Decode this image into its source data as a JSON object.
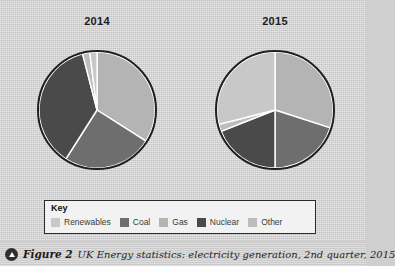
{
  "figure": {
    "number_label": "Figure 2",
    "caption": "UK Energy statistics: electricity generation, 2nd quarter, 2015",
    "icon": "triangle-up-circle-icon"
  },
  "key": {
    "title": "Key",
    "items": [
      {
        "label": "Renewables",
        "color": "#c8c8c8"
      },
      {
        "label": "Coal",
        "color": "#6e6e6e"
      },
      {
        "label": "Gas",
        "color": "#b4b4b4"
      },
      {
        "label": "Nuclear",
        "color": "#4a4a4a"
      },
      {
        "label": "Other",
        "color": "#bdbdbd"
      }
    ]
  },
  "chart_data": {
    "type": "pie",
    "title": "UK Energy statistics: electricity generation, 2nd quarter, 2015",
    "legend_position": "bottom",
    "categories": [
      "Gas",
      "Coal",
      "Nuclear",
      "Other",
      "Renewables"
    ],
    "colors": {
      "Renewables": "#c8c8c8",
      "Coal": "#6e6e6e",
      "Gas": "#b4b4b4",
      "Nuclear": "#4a4a4a",
      "Other": "#bdbdbd"
    },
    "charts": [
      {
        "label": "2014",
        "slices": [
          {
            "name": "Gas",
            "percent": 34
          },
          {
            "name": "Coal",
            "percent": 25
          },
          {
            "name": "Nuclear",
            "percent": 37
          },
          {
            "name": "Other",
            "percent": 2
          },
          {
            "name": "Renewables",
            "percent": 2
          }
        ]
      },
      {
        "label": "2015",
        "slices": [
          {
            "name": "Gas",
            "percent": 30
          },
          {
            "name": "Coal",
            "percent": 20
          },
          {
            "name": "Nuclear",
            "percent": 19
          },
          {
            "name": "Other",
            "percent": 2
          },
          {
            "name": "Renewables",
            "percent": 29
          }
        ]
      }
    ]
  }
}
